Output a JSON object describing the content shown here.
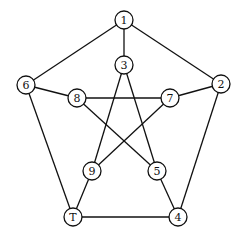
{
  "diagram": {
    "type": "graph",
    "node_radius": 9,
    "nodes": [
      {
        "id": "1",
        "label": "1",
        "x": 124,
        "y": 20
      },
      {
        "id": "2",
        "label": "2",
        "x": 221,
        "y": 84
      },
      {
        "id": "3",
        "label": "3",
        "x": 124,
        "y": 65
      },
      {
        "id": "4",
        "label": "4",
        "x": 178,
        "y": 217
      },
      {
        "id": "5",
        "label": "5",
        "x": 157,
        "y": 171
      },
      {
        "id": "6",
        "label": "6",
        "x": 26,
        "y": 85
      },
      {
        "id": "7",
        "label": "7",
        "x": 170,
        "y": 98
      },
      {
        "id": "8",
        "label": "8",
        "x": 77,
        "y": 98
      },
      {
        "id": "9",
        "label": "9",
        "x": 92,
        "y": 171
      },
      {
        "id": "T",
        "label": "T",
        "x": 73,
        "y": 217
      }
    ],
    "edges": [
      [
        "1",
        "6"
      ],
      [
        "1",
        "2"
      ],
      [
        "1",
        "3"
      ],
      [
        "6",
        "8"
      ],
      [
        "6",
        "T"
      ],
      [
        "2",
        "7"
      ],
      [
        "2",
        "4"
      ],
      [
        "8",
        "7"
      ],
      [
        "8",
        "5"
      ],
      [
        "3",
        "9"
      ],
      [
        "3",
        "5"
      ],
      [
        "7",
        "9"
      ],
      [
        "9",
        "T"
      ],
      [
        "5",
        "4"
      ],
      [
        "T",
        "4"
      ]
    ]
  }
}
